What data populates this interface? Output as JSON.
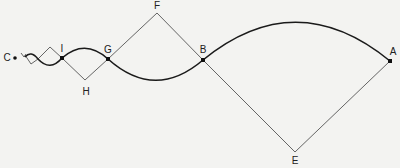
{
  "diagram": {
    "type": "geometric-construction",
    "labels": {
      "A": "A",
      "B": "B",
      "C": "C",
      "E": "E",
      "F": "F",
      "G": "G",
      "H": "H",
      "I": "I"
    },
    "points": {
      "A": [
        390,
        61
      ],
      "B": [
        203,
        60
      ],
      "C": [
        15,
        58
      ],
      "E": [
        295,
        152
      ],
      "F": [
        157,
        13
      ],
      "G": [
        108,
        59
      ],
      "H": [
        85,
        80
      ],
      "I": [
        62,
        58
      ]
    },
    "colors": {
      "background": "#f3f3f1",
      "line": "#555555",
      "arc": "#1a1a1a"
    }
  }
}
